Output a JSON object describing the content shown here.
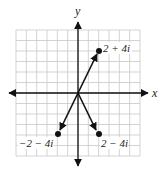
{
  "diagram": {
    "type": "complex-plane-vectors",
    "axes": {
      "x_label": "x",
      "y_label": "y"
    },
    "grid": {
      "columns": 12,
      "rows": 12,
      "x_range": [
        -6,
        6
      ],
      "y_range": [
        -6,
        6
      ]
    },
    "points": [
      {
        "label": "2 + 4i",
        "re": 2,
        "im": 4
      },
      {
        "label": "−2 − 4i",
        "re": -2,
        "im": -4
      },
      {
        "label": "2 − 4i",
        "re": 2,
        "im": -4
      }
    ],
    "colors": {
      "grid": "#c8c8c8",
      "axis": "#111111",
      "vector": "#111111"
    }
  }
}
